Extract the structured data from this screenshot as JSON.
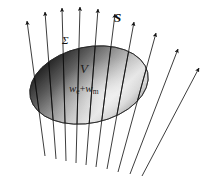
{
  "figure": {
    "background_color": "#ffffff",
    "width": 212,
    "height": 181,
    "labels": {
      "poynting_vector": "S",
      "surface": "Σ",
      "volume": "V",
      "energy_density_prefix": "w",
      "energy_density_sub_electric": "e",
      "energy_density_plus": "+",
      "energy_density_symbol2": "w",
      "energy_density_sub_magnetic": "m"
    },
    "colors": {
      "arrow_stroke": "#1a1a1a",
      "ellipse_dark": "#1c1c1c",
      "ellipse_mid": "#8c8c8c",
      "ellipse_light": "#f2f2f2",
      "ellipse_outline": "#2a2a2a",
      "label_color": "#101010"
    },
    "ellipse": {
      "cx": 89,
      "cy": 85,
      "rx": 60,
      "ry": 38,
      "rotation_deg": -12
    },
    "arrows": [
      {
        "id": "arrow-1",
        "x1": 45,
        "y1": 156,
        "x2": 27,
        "y2": 21
      },
      {
        "id": "arrow-2",
        "x1": 56,
        "y1": 159,
        "x2": 45,
        "y2": 12
      },
      {
        "id": "arrow-3",
        "x1": 66,
        "y1": 161,
        "x2": 62,
        "y2": 8
      },
      {
        "id": "arrow-4",
        "x1": 76,
        "y1": 163,
        "x2": 80,
        "y2": 7
      },
      {
        "id": "arrow-5",
        "x1": 86,
        "y1": 165,
        "x2": 98,
        "y2": 9
      },
      {
        "id": "arrow-6",
        "x1": 96,
        "y1": 167,
        "x2": 115,
        "y2": 14
      },
      {
        "id": "arrow-7",
        "x1": 107,
        "y1": 169,
        "x2": 134,
        "y2": 22
      },
      {
        "id": "arrow-8",
        "x1": 118,
        "y1": 172,
        "x2": 156,
        "y2": 33
      },
      {
        "id": "arrow-9",
        "x1": 130,
        "y1": 174,
        "x2": 178,
        "y2": 49
      },
      {
        "id": "arrow-10",
        "x1": 142,
        "y1": 176,
        "x2": 199,
        "y2": 68
      }
    ],
    "label_positions": {
      "S": {
        "left": 114,
        "top": 11
      },
      "Sigma": {
        "left": 62,
        "top": 35
      },
      "V": {
        "left": 80,
        "top": 62
      },
      "energy": {
        "left": 69,
        "top": 83
      }
    }
  }
}
